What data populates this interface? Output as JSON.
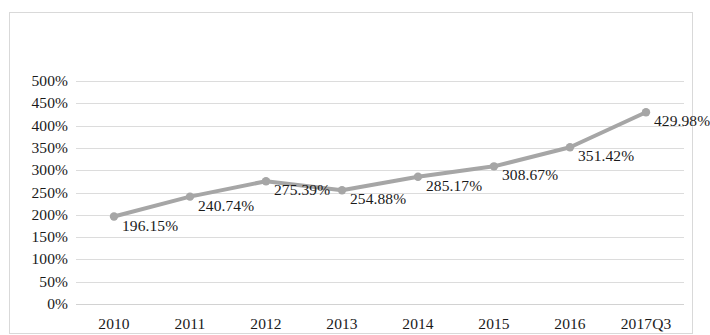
{
  "chart_data": {
    "type": "line",
    "title": "",
    "subtitle": "",
    "xlabel": "",
    "ylabel": "",
    "categories": [
      "2010",
      "2011",
      "2012",
      "2013",
      "2014",
      "2015",
      "2016",
      "2017Q3"
    ],
    "values": [
      196.15,
      240.74,
      275.39,
      254.88,
      285.17,
      308.67,
      351.42,
      429.98
    ],
    "value_labels": [
      "196.15%",
      "240.74%",
      "275.39%",
      "254.88%",
      "285.17%",
      "308.67%",
      "351.42%",
      "429.98%"
    ],
    "ylim": [
      0,
      500
    ],
    "ytick_values": [
      500,
      450,
      400,
      350,
      300,
      250,
      200,
      150,
      100,
      50,
      0
    ],
    "ytick_labels": [
      "500%",
      "450%",
      "400%",
      "350%",
      "300%",
      "250%",
      "200%",
      "150%",
      "100%",
      "50%",
      "0%"
    ],
    "grid": true,
    "legend": false,
    "series": [
      {
        "name": "",
        "values": [
          196.15,
          240.74,
          275.39,
          254.88,
          285.17,
          308.67,
          351.42,
          429.98
        ]
      }
    ],
    "colors": {
      "line": "#a6a6a6",
      "marker": "#a6a6a6",
      "gridline": "#dcdcdc",
      "border": "#d9d9d9",
      "text": "#1a1a1a",
      "background": "#ffffff"
    },
    "marker": "circle",
    "line_width": 4
  }
}
